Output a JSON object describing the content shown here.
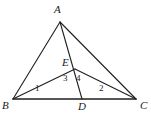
{
  "figure": {
    "width": 151,
    "height": 114,
    "background_color": "#ffffff",
    "stroke_color": "#1f1f1f",
    "label_color": "#1a1a1a",
    "vertices": [
      {
        "name": "A",
        "label": "A",
        "x": 60,
        "y": 22,
        "label_x": 54,
        "label_y": 4
      },
      {
        "name": "B",
        "label": "B",
        "x": 13,
        "y": 99,
        "label_x": 2,
        "label_y": 100
      },
      {
        "name": "C",
        "label": "C",
        "x": 136,
        "y": 99,
        "label_x": 140,
        "label_y": 100
      },
      {
        "name": "D",
        "label": "D",
        "x": 82,
        "y": 99,
        "label_x": 78,
        "label_y": 101
      },
      {
        "name": "E",
        "label": "E",
        "x": 75,
        "y": 69,
        "label_x": 62,
        "label_y": 57
      }
    ],
    "segments": [
      {
        "name": "segment-AB",
        "from": "A",
        "to": "B",
        "x1": 60,
        "y1": 22,
        "x2": 13,
        "y2": 99
      },
      {
        "name": "segment-AC",
        "from": "A",
        "to": "C",
        "x1": 60,
        "y1": 22,
        "x2": 136,
        "y2": 99
      },
      {
        "name": "segment-BC",
        "from": "B",
        "to": "C",
        "x1": 13,
        "y1": 99,
        "x2": 136,
        "y2": 99
      },
      {
        "name": "segment-AD",
        "from": "A",
        "to": "D",
        "x1": 60,
        "y1": 22,
        "x2": 82,
        "y2": 99
      },
      {
        "name": "segment-BE",
        "from": "B",
        "to": "E",
        "x1": 13,
        "y1": 99,
        "x2": 75,
        "y2": 69
      },
      {
        "name": "segment-EC",
        "from": "E",
        "to": "C",
        "x1": 75,
        "y1": 69,
        "x2": 136,
        "y2": 99
      }
    ],
    "angle_labels": [
      {
        "name": "angle-1",
        "label": "1",
        "x": 35,
        "y": 84
      },
      {
        "name": "angle-2",
        "label": "2",
        "x": 99,
        "y": 84
      },
      {
        "name": "angle-3",
        "label": "3",
        "x": 63,
        "y": 74
      },
      {
        "name": "angle-4",
        "label": "4",
        "x": 76,
        "y": 74
      }
    ]
  }
}
